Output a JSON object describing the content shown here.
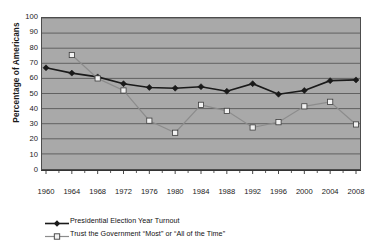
{
  "chart_data": {
    "type": "line",
    "title": "",
    "xlabel": "",
    "ylabel": "Percentage of Americans",
    "ylim": [
      0,
      100
    ],
    "ytick_step": 10,
    "grid": true,
    "legend_position": "bottom-left",
    "plot_background": "#a9a9a9",
    "categories": [
      "1960",
      "1964",
      "1968",
      "1972",
      "1976",
      "1980",
      "1984",
      "1988",
      "1992",
      "1996",
      "2000",
      "2004",
      "2008"
    ],
    "yticks": [
      "100",
      "90",
      "80",
      "70",
      "60",
      "50",
      "40",
      "30",
      "20",
      "10",
      "0"
    ],
    "series": [
      {
        "name": "Presidential Election Year Turnout",
        "marker": "filled-diamond",
        "color": "#1a1a1a",
        "values": [
          67,
          63.5,
          61,
          56.5,
          54,
          53.5,
          54.5,
          51.5,
          56.5,
          49.5,
          52,
          58.5,
          59
        ]
      },
      {
        "name": "Trust the Government \"Most\" or \"All of the Time\"",
        "marker": "open-square",
        "color": "#f2f2f2",
        "line_color": "#8c8c8c",
        "values": [
          null,
          75.5,
          60,
          52,
          32,
          24,
          42.5,
          38.5,
          27.5,
          31,
          41.5,
          44.5,
          29.5
        ]
      }
    ]
  },
  "legend": {
    "items": [
      {
        "label": "Presidential Election Year Turnout",
        "marker": "filled-diamond"
      },
      {
        "label": "Trust the Government “Most” or “All of the Time”",
        "marker": "open-square"
      }
    ]
  }
}
